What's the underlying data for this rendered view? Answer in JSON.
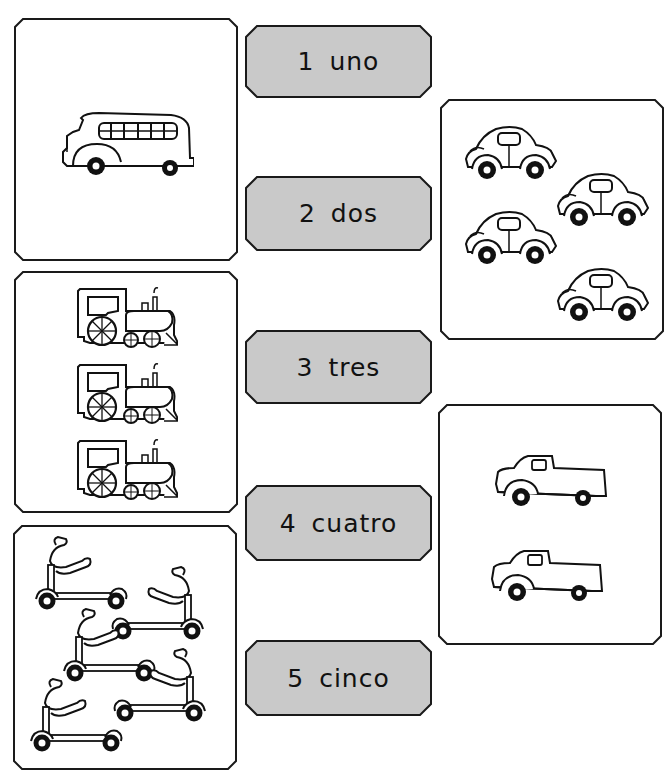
{
  "worksheet": {
    "labels": [
      {
        "number": "1",
        "word": "uno",
        "text": "1 uno"
      },
      {
        "number": "2",
        "word": "dos",
        "text": "2 dos"
      },
      {
        "number": "3",
        "word": "tres",
        "text": "3 tres"
      },
      {
        "number": "4",
        "word": "cuatro",
        "text": "4 cuatro"
      },
      {
        "number": "5",
        "word": "cinco",
        "text": "5 cinco"
      }
    ],
    "cards": [
      {
        "subject": "bus",
        "count": 1
      },
      {
        "subject": "car",
        "count": 4
      },
      {
        "subject": "train",
        "count": 3
      },
      {
        "subject": "truck",
        "count": 2
      },
      {
        "subject": "scooter",
        "count": 5
      }
    ],
    "colors": {
      "label_fill": "#c9c9c9",
      "outline": "#1a1a1a",
      "background": "#ffffff"
    }
  }
}
